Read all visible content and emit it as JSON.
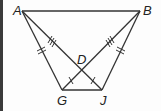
{
  "figure": {
    "points": {
      "A": {
        "label": "A",
        "x": 22,
        "y": 11
      },
      "B": {
        "label": "B",
        "x": 140,
        "y": 11
      },
      "G": {
        "label": "G",
        "x": 62,
        "y": 90
      },
      "J": {
        "label": "J",
        "x": 102,
        "y": 90
      },
      "D": {
        "label": "D",
        "x": 82,
        "y": 70
      }
    },
    "segments": [
      "AB",
      "AG",
      "BJ",
      "GJ",
      "AJ",
      "BG"
    ],
    "congruence_marks": {
      "AG": 2,
      "BJ": 2,
      "AD": 3,
      "BD": 3,
      "GD": 1,
      "JD": 1
    },
    "colors": {
      "line": "#333333",
      "border": "#3a3a3a"
    }
  }
}
